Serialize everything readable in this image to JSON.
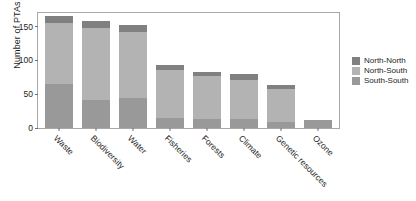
{
  "chart_data": {
    "type": "bar",
    "stacked": true,
    "title": "",
    "subtitle": "",
    "xlabel": "",
    "ylabel": "Number of PTAs",
    "ylim": [
      0,
      170
    ],
    "yticks": [
      0,
      50,
      100,
      150
    ],
    "ytick_labels": [
      "0",
      "50",
      "100",
      "150"
    ],
    "grid": false,
    "legend_position": "right",
    "categories": [
      "Waste",
      "Biodiversity",
      "Water",
      "Fisheries",
      "Forests",
      "Climate",
      "Genetic resources",
      "Ozone"
    ],
    "series": [
      {
        "name": "South-South",
        "color": "#999999",
        "values": [
          64,
          40,
          44,
          14,
          13,
          13,
          9,
          12
        ]
      },
      {
        "name": "North-South",
        "color": "#b3b3b3",
        "values": [
          89,
          105,
          96,
          70,
          62,
          57,
          47,
          0
        ]
      },
      {
        "name": "North-North",
        "color": "#808080",
        "values": [
          10,
          10,
          10,
          8,
          7,
          8,
          6,
          0
        ]
      }
    ],
    "totals": [
      163,
      155,
      150,
      92,
      82,
      78,
      62,
      12
    ],
    "legend": [
      {
        "label": "North-North",
        "color": "#808080"
      },
      {
        "label": "North-South",
        "color": "#b3b3b3"
      },
      {
        "label": "South-South",
        "color": "#999999"
      }
    ],
    "colors": {
      "north_north": "#808080",
      "north_south": "#b3b3b3",
      "south_south": "#999999",
      "axis": "#6f6f6f",
      "frame": "#a8a8a8",
      "text": "#1d1d1d",
      "background": "#ffffff"
    }
  }
}
